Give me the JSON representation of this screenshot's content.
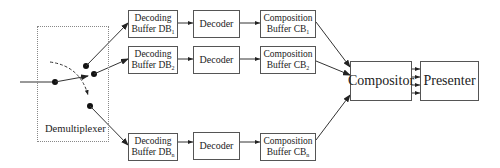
{
  "diagram": {
    "demultiplexer": {
      "label": "Demultiplexer"
    },
    "channels": [
      {
        "decoding_buffer": {
          "line1": "Decoding",
          "line2": "Buffer DB",
          "sub": "1"
        },
        "decoder": {
          "label": "Decoder"
        },
        "composition_buffer": {
          "line1": "Composition",
          "line2": "Buffer CB",
          "sub": "1"
        }
      },
      {
        "decoding_buffer": {
          "line1": "Decoding",
          "line2": "Buffer DB",
          "sub": "2"
        },
        "decoder": {
          "label": "Decoder"
        },
        "composition_buffer": {
          "line1": "Composition",
          "line2": "Buffer CB",
          "sub": "2"
        }
      },
      {
        "decoding_buffer": {
          "line1": "Decoding",
          "line2": "Buffer DB",
          "sub": "n"
        },
        "decoder": {
          "label": "Decoder"
        },
        "composition_buffer": {
          "line1": "Composition",
          "line2": "Buffer CB",
          "sub": "n"
        }
      }
    ],
    "compositor": {
      "label": "Compositor"
    },
    "presenter": {
      "label": "Presenter"
    }
  }
}
